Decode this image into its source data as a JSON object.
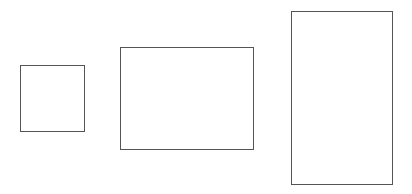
{
  "canvas": {
    "width": 412,
    "height": 194,
    "background": "#ffffff"
  },
  "shapes": [
    {
      "type": "rectangle",
      "label": "",
      "x": 20,
      "y": 65,
      "width": 65,
      "height": 67,
      "stroke": "#555555",
      "fill": "#ffffff"
    },
    {
      "type": "rectangle",
      "label": "",
      "x": 120,
      "y": 47,
      "width": 134,
      "height": 103,
      "stroke": "#555555",
      "fill": "#ffffff"
    },
    {
      "type": "rectangle",
      "label": "",
      "x": 291,
      "y": 11,
      "width": 102,
      "height": 174,
      "stroke": "#555555",
      "fill": "#ffffff"
    }
  ]
}
